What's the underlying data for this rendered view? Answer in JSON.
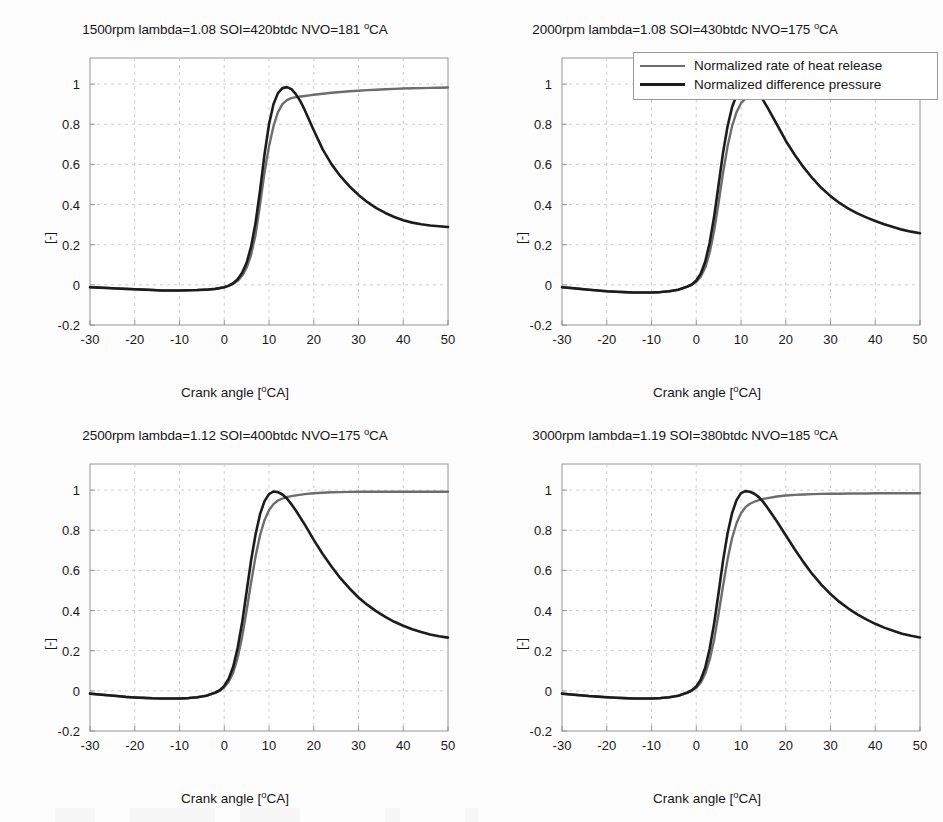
{
  "figure": {
    "background": "#fdfdfd",
    "width": 943,
    "height": 822
  },
  "colors": {
    "heat_release": "#6d6d6d",
    "difference_pressure": "#1c1c1c",
    "grid": "#c8c8c8",
    "axis": "#8a8a8a",
    "text": "#151515"
  },
  "legend": {
    "entries": [
      {
        "label": "Normalized rate of heat release",
        "color": "#6d6d6d"
      },
      {
        "label": "Normalized difference pressure",
        "color": "#1c1c1c"
      }
    ]
  },
  "axis": {
    "xlabel_prefix": "Crank angle [",
    "xlabel_sup": "o",
    "xlabel_suffix": "CA]",
    "ylabel": "[-]",
    "xticks": [
      "-30",
      "-20",
      "-10",
      "0",
      "10",
      "20",
      "30",
      "40",
      "50"
    ],
    "yticks": [
      "1",
      "0.8",
      "0.6",
      "0.4",
      "0.2",
      "0",
      "-0.2"
    ],
    "xlim": [
      -30,
      50
    ],
    "ylim": [
      -0.2,
      1.13
    ]
  },
  "chart_data": [
    {
      "id": "panel-1500rpm",
      "type": "line",
      "title": "1500rpm lambda=1.08 SOI=420btdc NVO=181 °CA",
      "title_parts": {
        "pre": "1500rpm lambda=1.08 SOI=420btdc NVO=181 ",
        "sup": "o",
        "post": "CA"
      },
      "rpm": 1500,
      "lambda": 1.08,
      "soi_btdc": 420,
      "nvo_deg_ca": 181,
      "xlabel": "Crank angle [oCA]",
      "ylabel": "[-]",
      "xlim": [
        -30,
        50
      ],
      "ylim": [
        -0.2,
        1.13
      ],
      "grid": true,
      "legend_position": "none",
      "x": [
        -30,
        -28,
        -26,
        -24,
        -22,
        -20,
        -18,
        -16,
        -14,
        -12,
        -10,
        -8,
        -6,
        -4,
        -2,
        0,
        1,
        2,
        3,
        4,
        5,
        6,
        7,
        8,
        9,
        10,
        11,
        12,
        13,
        14,
        15,
        16,
        17,
        18,
        19,
        20,
        22,
        24,
        26,
        28,
        30,
        32,
        34,
        36,
        38,
        40,
        42,
        44,
        46,
        48,
        50
      ],
      "series": [
        {
          "name": "Normalized rate of heat release",
          "color": "#6d6d6d",
          "values": [
            -0.012,
            -0.014,
            -0.016,
            -0.018,
            -0.02,
            -0.022,
            -0.024,
            -0.026,
            -0.028,
            -0.028,
            -0.028,
            -0.027,
            -0.026,
            -0.024,
            -0.02,
            -0.012,
            -0.005,
            0.005,
            0.02,
            0.045,
            0.085,
            0.15,
            0.25,
            0.4,
            0.56,
            0.69,
            0.79,
            0.86,
            0.9,
            0.92,
            0.93,
            0.935,
            0.938,
            0.941,
            0.944,
            0.947,
            0.952,
            0.957,
            0.961,
            0.964,
            0.967,
            0.97,
            0.972,
            0.974,
            0.976,
            0.978,
            0.979,
            0.98,
            0.981,
            0.982,
            0.983
          ]
        },
        {
          "name": "Normalized difference pressure",
          "color": "#1c1c1c",
          "values": [
            -0.012,
            -0.014,
            -0.016,
            -0.018,
            -0.02,
            -0.022,
            -0.024,
            -0.026,
            -0.028,
            -0.028,
            -0.028,
            -0.027,
            -0.026,
            -0.024,
            -0.02,
            -0.012,
            -0.004,
            0.008,
            0.028,
            0.06,
            0.11,
            0.19,
            0.31,
            0.47,
            0.65,
            0.8,
            0.9,
            0.955,
            0.98,
            0.985,
            0.975,
            0.95,
            0.915,
            0.87,
            0.82,
            0.77,
            0.675,
            0.6,
            0.54,
            0.49,
            0.448,
            0.412,
            0.382,
            0.358,
            0.338,
            0.322,
            0.31,
            0.302,
            0.296,
            0.292,
            0.288
          ]
        }
      ]
    },
    {
      "id": "panel-2000rpm",
      "type": "line",
      "title": "2000rpm lambda=1.08 SOI=430btdc NVO=175 °CA",
      "title_parts": {
        "pre": "2000rpm lambda=1.08 SOI=430btdc NVO=175 ",
        "sup": "o",
        "post": "CA"
      },
      "rpm": 2000,
      "lambda": 1.08,
      "soi_btdc": 430,
      "nvo_deg_ca": 175,
      "xlabel": "Crank angle [oCA]",
      "ylabel": "[-]",
      "xlim": [
        -30,
        50
      ],
      "ylim": [
        -0.2,
        1.13
      ],
      "grid": true,
      "legend_position": "top-right-outside",
      "x": [
        -30,
        -28,
        -26,
        -24,
        -22,
        -20,
        -18,
        -16,
        -14,
        -12,
        -10,
        -8,
        -6,
        -4,
        -2,
        -1,
        0,
        1,
        2,
        3,
        4,
        5,
        6,
        7,
        8,
        9,
        10,
        11,
        12,
        13,
        14,
        15,
        16,
        18,
        20,
        22,
        24,
        26,
        28,
        30,
        32,
        34,
        36,
        38,
        40,
        42,
        44,
        46,
        48,
        50
      ],
      "series": [
        {
          "name": "Normalized rate of heat release",
          "color": "#6d6d6d",
          "values": [
            -0.012,
            -0.016,
            -0.02,
            -0.024,
            -0.028,
            -0.032,
            -0.034,
            -0.036,
            -0.038,
            -0.038,
            -0.038,
            -0.036,
            -0.032,
            -0.024,
            -0.01,
            0.0,
            0.015,
            0.04,
            0.085,
            0.16,
            0.27,
            0.41,
            0.56,
            0.69,
            0.79,
            0.86,
            0.905,
            0.928,
            0.94,
            0.948,
            0.953,
            0.957,
            0.96,
            0.966,
            0.971,
            0.975,
            0.979,
            0.982,
            0.984,
            0.986,
            0.987,
            0.988,
            0.988,
            0.988,
            0.988,
            0.988,
            0.988,
            0.988,
            0.987,
            0.987
          ]
        },
        {
          "name": "Normalized difference pressure",
          "color": "#1c1c1c",
          "values": [
            -0.012,
            -0.016,
            -0.02,
            -0.024,
            -0.028,
            -0.032,
            -0.034,
            -0.036,
            -0.038,
            -0.038,
            -0.038,
            -0.036,
            -0.032,
            -0.024,
            -0.008,
            0.002,
            0.022,
            0.055,
            0.115,
            0.21,
            0.34,
            0.5,
            0.66,
            0.79,
            0.885,
            0.945,
            0.98,
            0.993,
            0.99,
            0.975,
            0.95,
            0.918,
            0.88,
            0.8,
            0.718,
            0.648,
            0.585,
            0.53,
            0.482,
            0.442,
            0.408,
            0.38,
            0.356,
            0.336,
            0.318,
            0.302,
            0.288,
            0.275,
            0.265,
            0.257
          ]
        }
      ]
    },
    {
      "id": "panel-2500rpm",
      "type": "line",
      "title": "2500rpm lambda=1.12 SOI=400btdc NVO=175 °CA",
      "title_parts": {
        "pre": "2500rpm lambda=1.12 SOI=400btdc NVO=175 ",
        "sup": "o",
        "post": "CA"
      },
      "rpm": 2500,
      "lambda": 1.12,
      "soi_btdc": 400,
      "nvo_deg_ca": 175,
      "xlabel": "Crank angle [oCA]",
      "ylabel": "[-]",
      "xlim": [
        -30,
        50
      ],
      "ylim": [
        -0.2,
        1.13
      ],
      "grid": true,
      "legend_position": "none",
      "x": [
        -30,
        -28,
        -26,
        -24,
        -22,
        -20,
        -18,
        -16,
        -14,
        -12,
        -10,
        -8,
        -6,
        -4,
        -2,
        -1,
        0,
        1,
        2,
        3,
        4,
        5,
        6,
        7,
        8,
        9,
        10,
        11,
        12,
        13,
        14,
        15,
        16,
        18,
        20,
        22,
        24,
        26,
        28,
        30,
        32,
        34,
        36,
        38,
        40,
        42,
        44,
        46,
        48,
        50
      ],
      "series": [
        {
          "name": "Normalized rate of heat release",
          "color": "#6d6d6d",
          "values": [
            -0.014,
            -0.018,
            -0.022,
            -0.026,
            -0.03,
            -0.033,
            -0.035,
            -0.037,
            -0.038,
            -0.038,
            -0.038,
            -0.036,
            -0.032,
            -0.024,
            -0.01,
            0.0,
            0.018,
            0.045,
            0.09,
            0.165,
            0.27,
            0.4,
            0.54,
            0.67,
            0.775,
            0.85,
            0.9,
            0.93,
            0.948,
            0.958,
            0.965,
            0.97,
            0.974,
            0.98,
            0.984,
            0.987,
            0.989,
            0.99,
            0.991,
            0.992,
            0.992,
            0.992,
            0.992,
            0.992,
            0.992,
            0.992,
            0.992,
            0.992,
            0.992,
            0.992
          ]
        },
        {
          "name": "Normalized difference pressure",
          "color": "#1c1c1c",
          "values": [
            -0.014,
            -0.018,
            -0.022,
            -0.026,
            -0.03,
            -0.033,
            -0.035,
            -0.037,
            -0.038,
            -0.038,
            -0.038,
            -0.036,
            -0.032,
            -0.024,
            -0.008,
            0.003,
            0.025,
            0.06,
            0.12,
            0.215,
            0.34,
            0.495,
            0.65,
            0.78,
            0.88,
            0.945,
            0.98,
            0.993,
            0.99,
            0.978,
            0.958,
            0.93,
            0.898,
            0.828,
            0.752,
            0.682,
            0.618,
            0.56,
            0.51,
            0.465,
            0.428,
            0.396,
            0.368,
            0.344,
            0.324,
            0.307,
            0.293,
            0.281,
            0.272,
            0.265
          ]
        }
      ]
    },
    {
      "id": "panel-3000rpm",
      "type": "line",
      "title": "3000rpm lambda=1.19 SOI=380btdc NVO=185 °CA",
      "title_parts": {
        "pre": "3000rpm lambda=1.19 SOI=380btdc NVO=185 ",
        "sup": "o",
        "post": "CA"
      },
      "rpm": 3000,
      "lambda": 1.19,
      "soi_btdc": 380,
      "nvo_deg_ca": 185,
      "xlabel": "Crank angle [oCA]",
      "ylabel": "[-]",
      "xlim": [
        -30,
        50
      ],
      "ylim": [
        -0.2,
        1.13
      ],
      "grid": true,
      "legend_position": "none",
      "x": [
        -30,
        -28,
        -26,
        -24,
        -22,
        -20,
        -18,
        -16,
        -14,
        -12,
        -10,
        -8,
        -6,
        -4,
        -2,
        -1,
        0,
        1,
        2,
        3,
        4,
        5,
        6,
        7,
        8,
        9,
        10,
        11,
        12,
        13,
        14,
        15,
        16,
        18,
        20,
        22,
        24,
        26,
        28,
        30,
        32,
        34,
        36,
        38,
        40,
        42,
        44,
        46,
        48,
        50
      ],
      "series": [
        {
          "name": "Normalized rate of heat release",
          "color": "#6d6d6d",
          "values": [
            -0.014,
            -0.018,
            -0.022,
            -0.026,
            -0.029,
            -0.032,
            -0.034,
            -0.036,
            -0.038,
            -0.038,
            -0.038,
            -0.036,
            -0.032,
            -0.024,
            -0.01,
            0.0,
            0.015,
            0.04,
            0.085,
            0.155,
            0.255,
            0.385,
            0.525,
            0.655,
            0.76,
            0.835,
            0.885,
            0.915,
            0.932,
            0.942,
            0.95,
            0.956,
            0.96,
            0.968,
            0.973,
            0.976,
            0.978,
            0.98,
            0.981,
            0.982,
            0.982,
            0.983,
            0.983,
            0.983,
            0.984,
            0.984,
            0.984,
            0.984,
            0.984,
            0.984
          ]
        },
        {
          "name": "Normalized difference pressure",
          "color": "#1c1c1c",
          "values": [
            -0.014,
            -0.018,
            -0.022,
            -0.026,
            -0.029,
            -0.032,
            -0.034,
            -0.036,
            -0.038,
            -0.038,
            -0.038,
            -0.036,
            -0.032,
            -0.024,
            -0.008,
            0.003,
            0.022,
            0.055,
            0.115,
            0.21,
            0.335,
            0.49,
            0.65,
            0.785,
            0.885,
            0.95,
            0.985,
            0.995,
            0.992,
            0.982,
            0.965,
            0.94,
            0.91,
            0.845,
            0.775,
            0.705,
            0.64,
            0.58,
            0.528,
            0.482,
            0.443,
            0.41,
            0.381,
            0.356,
            0.334,
            0.315,
            0.299,
            0.285,
            0.274,
            0.266
          ]
        }
      ]
    }
  ]
}
